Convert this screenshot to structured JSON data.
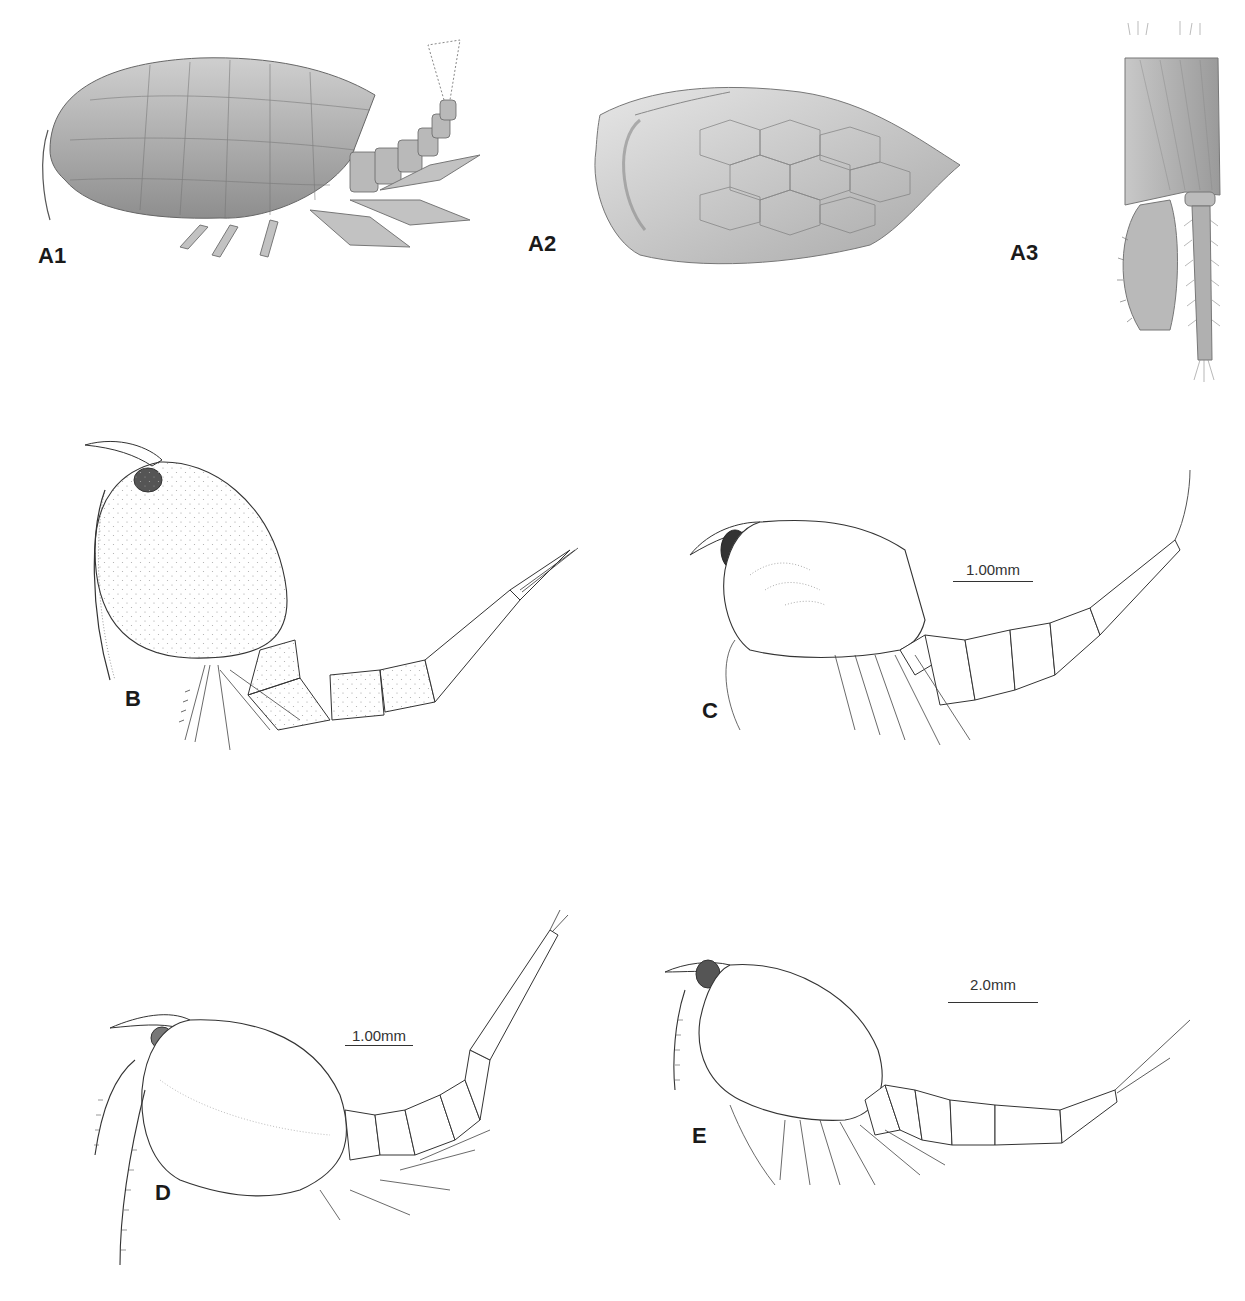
{
  "figure": {
    "panels": [
      {
        "id": "A1",
        "label": "A1",
        "description": "Whole animal, lateral view, shaded illustration with reticulated carapace"
      },
      {
        "id": "A2",
        "label": "A2",
        "description": "Carapace valve, lateral view, reticulate polygonal pattern"
      },
      {
        "id": "A3",
        "label": "A3",
        "description": "Appendage (uropod/furca) with setose rami, shaded"
      },
      {
        "id": "B",
        "label": "B",
        "description": "Whole animal, lateral view, stippled oval carapace, long segmented tail"
      },
      {
        "id": "C",
        "label": "C",
        "description": "Whole animal, lateral view, line drawing with dark eye"
      },
      {
        "id": "D",
        "label": "D",
        "description": "Whole animal, lateral view, line drawing with long antennae"
      },
      {
        "id": "E",
        "label": "E",
        "description": "Whole animal, lateral view, line drawing, long furcal setae"
      }
    ],
    "scale_bars": [
      {
        "panel": "C",
        "text": "1.00mm"
      },
      {
        "panel": "D",
        "text": "1.00mm"
      },
      {
        "panel": "E",
        "text": "2.0mm"
      }
    ],
    "colors": {
      "ink": "#333333",
      "shade": "#9a9a9a",
      "label": "#1a1a1a",
      "background": "#ffffff"
    }
  }
}
